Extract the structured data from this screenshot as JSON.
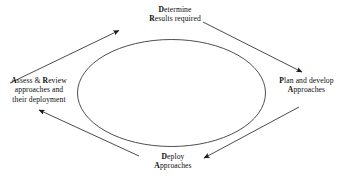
{
  "diagram": {
    "shape": "ellipse",
    "stroke_color": "#3a3a3a",
    "text_color": "#0d0d0d",
    "background": "#ffffff",
    "nodes": [
      {
        "id": "determine",
        "position": "top",
        "lines": [
          {
            "bold_prefix": "D",
            "rest": "etermine"
          },
          {
            "bold_prefix": "R",
            "rest": "esults required"
          }
        ]
      },
      {
        "id": "plan",
        "position": "right",
        "lines": [
          {
            "bold_prefix": "P",
            "rest": "lan and develop"
          },
          {
            "bold_prefix": "A",
            "rest": "pproaches"
          }
        ]
      },
      {
        "id": "deploy",
        "position": "bottom",
        "lines": [
          {
            "bold_prefix": "D",
            "rest": "eploy"
          },
          {
            "bold_prefix": "A",
            "rest": "pproaches"
          }
        ]
      },
      {
        "id": "assess",
        "position": "left",
        "lines": [
          {
            "bold_prefix": "A",
            "rest": "ssess & ",
            "bold_prefix2": "R",
            "rest2": "eview"
          },
          {
            "bold_prefix": "",
            "rest": "approaches and"
          },
          {
            "bold_prefix": "",
            "rest": "their deployment"
          }
        ]
      }
    ],
    "arrows": [
      {
        "id": "assess-to-determine",
        "from": "assess",
        "to": "determine",
        "direction": "up-right"
      },
      {
        "id": "determine-to-plan",
        "from": "determine",
        "to": "plan",
        "direction": "down-right"
      },
      {
        "id": "plan-to-deploy",
        "from": "plan",
        "to": "deploy",
        "direction": "down-left"
      },
      {
        "id": "deploy-to-assess",
        "from": "deploy",
        "to": "assess",
        "direction": "up-left"
      }
    ]
  },
  "labels": {
    "top": {
      "line1_bold": "D",
      "line1_rest": "etermine",
      "line2_bold": "R",
      "line2_rest": "esults required"
    },
    "left": {
      "line1_bold": "A",
      "line1_mid": "ssess & ",
      "line1_bold2": "R",
      "line1_rest": "eview",
      "line2": "approaches and",
      "line3": "their deployment"
    },
    "right": {
      "line1_bold": "P",
      "line1_rest": "lan and develop",
      "line2_bold": "A",
      "line2_rest": "pproaches"
    },
    "bottom": {
      "line1_bold": "D",
      "line1_rest": "eploy",
      "line2_bold": "A",
      "line2_rest": "pproaches"
    }
  }
}
